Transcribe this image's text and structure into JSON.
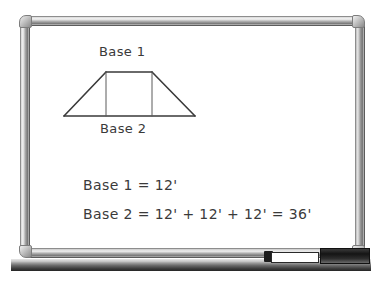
{
  "scene": {
    "kind": "whiteboard-photo",
    "background_color": "#ffffff"
  },
  "whiteboard": {
    "surface_color": "#ffffff",
    "frame_color": "#9a9a9a",
    "tray_color": "#3c3c3c"
  },
  "accessories": {
    "marker": {
      "name": "dry-erase-marker",
      "body_color": "#ffffff",
      "cap_color": "#1c1c1c"
    },
    "eraser": {
      "name": "whiteboard-eraser",
      "color": "#1e1e1e"
    }
  },
  "drawing": {
    "shape": "trapezoid",
    "ink_color": "#3a3a3a",
    "labels": {
      "top_base": "Base 1",
      "bottom_base": "Base 2"
    },
    "geometry": {
      "bottom_left": [
        7,
        51
      ],
      "bottom_right": [
        138,
        51
      ],
      "top_left": [
        49,
        7
      ],
      "top_right": [
        95,
        7
      ],
      "vertical_left": [
        49,
        7,
        49,
        51
      ],
      "vertical_right": [
        95,
        7,
        95,
        51
      ]
    }
  },
  "equations": [
    "Base 1 = 12'",
    "Base 2 = 12' + 12' + 12' = 36'"
  ],
  "values": {
    "base1_length": "12'",
    "base2_segment": "12'",
    "base2_segments": 3,
    "base2_total": "36'"
  }
}
